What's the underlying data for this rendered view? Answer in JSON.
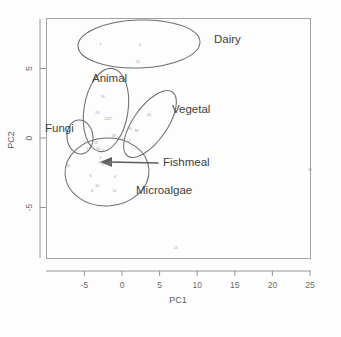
{
  "chart_data": {
    "type": "scatter",
    "title": "",
    "xlabel": "PC1",
    "ylabel": "PC2",
    "xlim": [
      -8.2,
      26.5
    ],
    "ylim": [
      -8.5,
      7.6
    ],
    "xticks": [
      "-5",
      "0",
      "5",
      "10",
      "15",
      "20",
      "25"
    ],
    "xtick_values": [
      -5,
      0,
      5,
      10,
      15,
      20,
      25
    ],
    "yticks": [
      "5",
      "0",
      "-5"
    ],
    "ytick_values": [
      5,
      0,
      -5
    ],
    "grid": false,
    "legend": "none",
    "point_label_field": "sample id",
    "points": [
      {
        "id": "7",
        "x": -2.9,
        "y": 6.6
      },
      {
        "id": "3",
        "x": 2.4,
        "y": 6.6
      },
      {
        "id": "22",
        "x": 2.1,
        "y": 5.4
      },
      {
        "id": "19",
        "x": -2.6,
        "y": 2.9
      },
      {
        "id": "24",
        "x": -3.3,
        "y": 1.7
      },
      {
        "id": "25",
        "x": -2.1,
        "y": 1.3
      },
      {
        "id": "27",
        "x": -1.6,
        "y": 1.3
      },
      {
        "id": "20",
        "x": 3.6,
        "y": 1.6
      },
      {
        "id": "26",
        "x": 1.0,
        "y": 0.55
      },
      {
        "id": "18",
        "x": 1.9,
        "y": 0.45
      },
      {
        "id": "28",
        "x": -1.1,
        "y": 0.1
      },
      {
        "id": "16",
        "x": 0.0,
        "y": -0.25
      },
      {
        "id": "17",
        "x": 0.9,
        "y": -0.3
      },
      {
        "id": "23",
        "x": -3.5,
        "y": -0.4
      },
      {
        "id": "21",
        "x": -4.5,
        "y": -0.85
      },
      {
        "id": "30",
        "x": -3.2,
        "y": -0.85
      },
      {
        "id": "2",
        "x": -2.6,
        "y": -1.0
      },
      {
        "id": "1",
        "x": -2.9,
        "y": -1.5
      },
      {
        "id": "5",
        "x": -3.0,
        "y": -1.9
      },
      {
        "id": "9",
        "x": -2.6,
        "y": -2.0
      },
      {
        "id": "13",
        "x": -1.8,
        "y": -1.95
      },
      {
        "id": "29",
        "x": -1.4,
        "y": -1.85
      },
      {
        "id": "32",
        "x": -7.2,
        "y": -2.1
      },
      {
        "id": "6",
        "x": -4.2,
        "y": -2.8
      },
      {
        "id": "10",
        "x": -3.3,
        "y": -3.5
      },
      {
        "id": "8",
        "x": -4.0,
        "y": -3.9
      },
      {
        "id": "4",
        "x": -0.9,
        "y": -2.9
      },
      {
        "id": "12",
        "x": -1.0,
        "y": -3.9
      },
      {
        "id": "31",
        "x": 25.0,
        "y": -2.4
      },
      {
        "id": "14",
        "x": 7.1,
        "y": -8.0
      }
    ],
    "clusters": [
      {
        "name": "Dairy",
        "label_x": 214,
        "label_y": 43
      },
      {
        "name": "Animal",
        "label_x": 92,
        "label_y": 82
      },
      {
        "name": "Vegetal",
        "label_x": 172,
        "label_y": 113
      },
      {
        "name": "Fungi",
        "label_x": 45,
        "label_y": 132
      },
      {
        "name": "Fishmeal",
        "label_x": 163,
        "label_y": 166
      },
      {
        "name": "Microalgae",
        "label_x": 136,
        "label_y": 194
      }
    ],
    "annotation": {
      "type": "arrow",
      "target": "Fishmeal",
      "points_to": "cluster of fishmeal samples",
      "from_x": 158,
      "from_y": 163,
      "to_x": 103,
      "to_y": 162
    }
  },
  "colors": {
    "point_label": "#9b9b9b",
    "ellipse": "#6e6e6e",
    "arrow": "#5e5e5e",
    "axis": "#8a8a8a",
    "cluster_text": "#3d3d3d",
    "background": "#fdfdfd"
  }
}
